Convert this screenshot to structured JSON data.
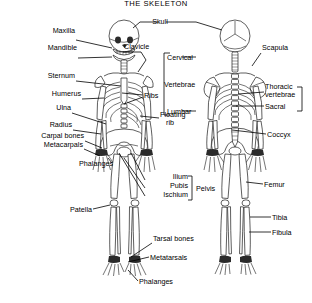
{
  "page": {
    "title": "THE SKELETON",
    "background_color": "#ffffff",
    "ink_color": "#000000"
  },
  "figures": [
    {
      "id": "anterior",
      "name": "anterior-skeleton",
      "caption_view": "front view"
    },
    {
      "id": "posterior",
      "name": "posterior-skeleton",
      "caption_view": "back view"
    }
  ],
  "labels": {
    "skull": "Skull",
    "maxilla": "Maxilla",
    "mandible": "Mandible",
    "clavicle": "Clavicle",
    "sternum": "Sternum",
    "humerus": "Humerus",
    "ulna": "Ulna",
    "radius": "Radius",
    "carpal_bones": "Carpal bones",
    "metacarpals": "Metacarpals",
    "phalanges_hand": "Phalanges",
    "ribs": "Ribs",
    "floating_rib_line1": "Floating",
    "floating_rib_line2": "rib",
    "cervical": "Cervical",
    "vertebrae": "Vertebrae",
    "lumbar": "Lumbar",
    "ilium": "Ilium",
    "pubis": "Pubis",
    "ischium": "Ischium",
    "pelvis": "Pelvis",
    "patella": "Patella",
    "tarsal_bones": "Tarsal bones",
    "metatarsals": "Metatarsals",
    "phalanges_foot": "Phalanges",
    "scapula": "Scapula",
    "thoracic_line1": "Thoracic",
    "thoracic_line2": "vertebrae",
    "sacral": "Sacral",
    "coccyx": "Coccyx",
    "femur": "Femur",
    "tibia": "Tibia",
    "fibula": "Fibula"
  }
}
